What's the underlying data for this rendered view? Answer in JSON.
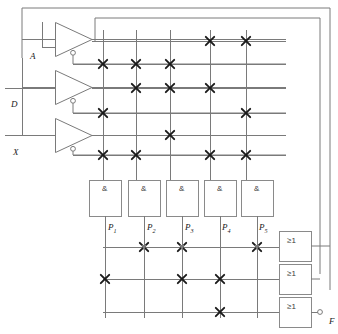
{
  "diagram": {
    "stroke_color": "#7a7a7a",
    "node_color": "#1a1a1a",
    "box_stroke": "#8a8a8a"
  },
  "inputs": [
    {
      "name": "input-a",
      "label": "A",
      "x": 30,
      "y": 51,
      "line_y": 47
    },
    {
      "name": "input-d",
      "label": "D",
      "x": 11,
      "y": 99,
      "line_y": 88
    },
    {
      "name": "input-x",
      "label": "X",
      "x": 13,
      "y": 147,
      "line_y": 135
    }
  ],
  "inverters": [
    {
      "name": "inverter-a",
      "x": 55,
      "y": 22,
      "w": 37,
      "h": 35
    },
    {
      "name": "inverter-d",
      "x": 55,
      "y": 70,
      "w": 37,
      "h": 35
    },
    {
      "name": "inverter-x",
      "x": 55,
      "y": 118,
      "w": 37,
      "h": 35
    }
  ],
  "and_gates": [
    {
      "name": "and-gate-1",
      "symbol": "&",
      "out_label": "P",
      "out_sub": "1",
      "x": 89,
      "y": 180,
      "w": 32,
      "h": 36,
      "label_x": 108,
      "label_y": 230
    },
    {
      "name": "and-gate-2",
      "symbol": "&",
      "out_label": "P",
      "out_sub": "2",
      "x": 128,
      "y": 180,
      "w": 32,
      "h": 36,
      "label_x": 147,
      "label_y": 230
    },
    {
      "name": "and-gate-3",
      "symbol": "&",
      "out_label": "P",
      "out_sub": "3",
      "x": 166,
      "y": 180,
      "w": 32,
      "h": 36,
      "label_x": 185,
      "label_y": 230
    },
    {
      "name": "and-gate-4",
      "symbol": "&",
      "out_label": "P",
      "out_sub": "4",
      "x": 204,
      "y": 180,
      "w": 32,
      "h": 36,
      "label_x": 222,
      "label_y": 230
    },
    {
      "name": "and-gate-5",
      "symbol": "&",
      "out_label": "P",
      "out_sub": "5",
      "x": 241,
      "y": 180,
      "w": 32,
      "h": 36,
      "label_x": 259,
      "label_y": 230
    }
  ],
  "or_gates": [
    {
      "name": "or-gate-1",
      "symbol": "≥1",
      "x": 279,
      "y": 231,
      "w": 32,
      "h": 30
    },
    {
      "name": "or-gate-2",
      "symbol": "≥1",
      "x": 279,
      "y": 264,
      "w": 32,
      "h": 30
    },
    {
      "name": "or-gate-3",
      "symbol": "≥1",
      "x": 279,
      "y": 297,
      "w": 32,
      "h": 30
    }
  ],
  "output": {
    "name": "output-f",
    "label": "F",
    "x": 329,
    "y": 316,
    "bubble_x": 320,
    "bubble_y": 312
  },
  "grid": {
    "and_columns_x": [
      103,
      136,
      170,
      210,
      246
    ],
    "and_rows_y": [
      41,
      64,
      88,
      113,
      135,
      155
    ],
    "or_rows_y": [
      247,
      279,
      312
    ],
    "row_signal_names": [
      "A",
      "notA",
      "D",
      "notD",
      "X",
      "notX"
    ]
  },
  "and_plane_connections": [
    {
      "row": 0,
      "col": 3
    },
    {
      "row": 0,
      "col": 4
    },
    {
      "row": 1,
      "col": 0
    },
    {
      "row": 1,
      "col": 1
    },
    {
      "row": 1,
      "col": 2
    },
    {
      "row": 2,
      "col": 1
    },
    {
      "row": 2,
      "col": 2
    },
    {
      "row": 2,
      "col": 3
    },
    {
      "row": 3,
      "col": 0
    },
    {
      "row": 3,
      "col": 4
    },
    {
      "row": 4,
      "col": 2
    },
    {
      "row": 5,
      "col": 0
    },
    {
      "row": 5,
      "col": 1
    },
    {
      "row": 5,
      "col": 3
    },
    {
      "row": 5,
      "col": 4
    }
  ],
  "or_plane_connections": [
    {
      "row": 0,
      "col": 1
    },
    {
      "row": 0,
      "col": 2
    },
    {
      "row": 0,
      "col": 4
    },
    {
      "row": 1,
      "col": 0
    },
    {
      "row": 1,
      "col": 2
    },
    {
      "row": 1,
      "col": 3
    },
    {
      "row": 2,
      "col": 3
    }
  ]
}
